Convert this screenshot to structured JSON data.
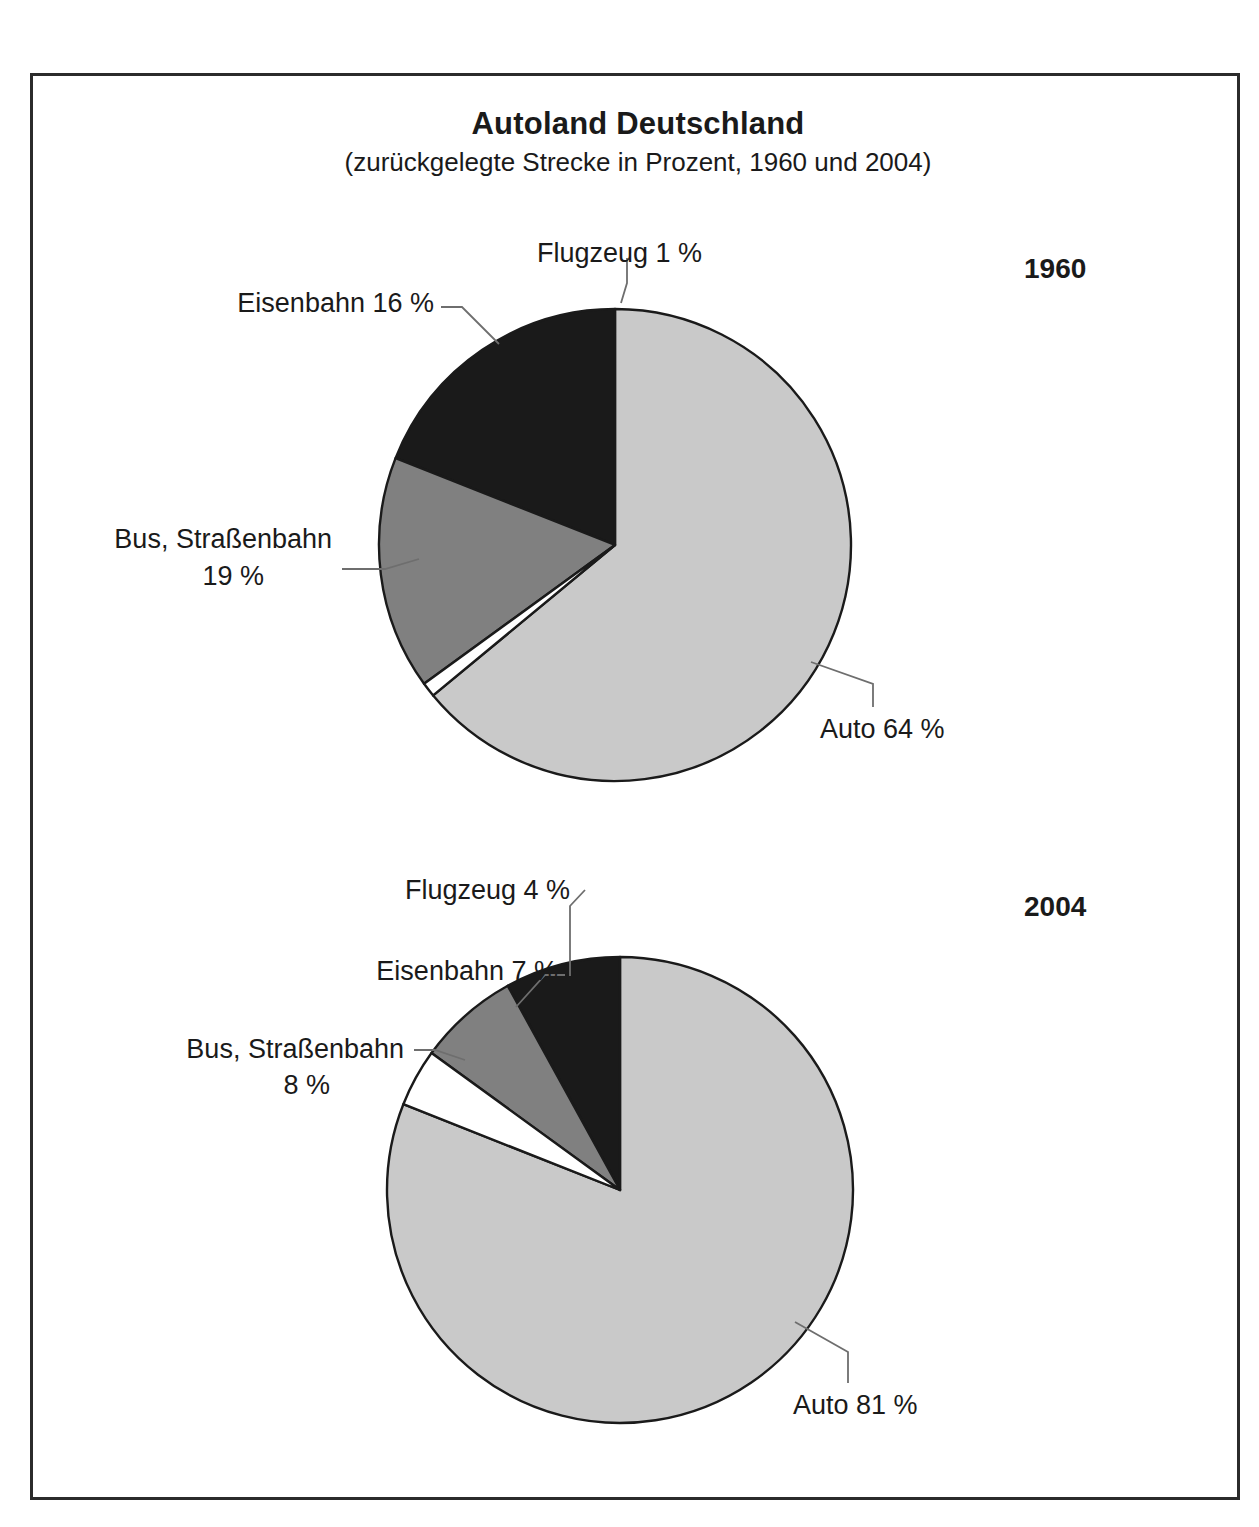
{
  "figure": {
    "title": "Autoland Deutschland",
    "subtitle": "(zurückgelegte Strecke in Prozent, 1960 und 2004)",
    "colors": {
      "auto": "#c9c9c9",
      "eisenbahn": "#808080",
      "bus": "#1a1a1a",
      "flugzeug": "#ffffff",
      "outline": "#1a1a1a",
      "leader": "#6e6e6e",
      "frame": "#2b2b2b",
      "background": "#ffffff"
    }
  },
  "charts": [
    {
      "year_label": "1960",
      "labels": {
        "flugzeug": "Flugzeug 1 %",
        "eisenbahn": "Eisenbahn 16 %",
        "bus_line1": "Bus, Straßenbahn",
        "bus_line2": "19 %",
        "auto": "Auto 64 %"
      }
    },
    {
      "year_label": "2004",
      "labels": {
        "flugzeug": "Flugzeug 4 %",
        "eisenbahn": "Eisenbahn 7 %",
        "bus_line1": "Bus, Straßenbahn",
        "bus_line2": "8 %",
        "auto": "Auto 81 %"
      }
    }
  ],
  "chart_data": [
    {
      "type": "pie",
      "title": "Autoland Deutschland",
      "subtitle": "(zurückgelegte Strecke in Prozent, 1960 und 2004)",
      "series_name": "1960",
      "unit": "%",
      "start_angle_deg": 0,
      "direction": "clockwise",
      "legend": "none (direct labels with leader lines)",
      "categories": [
        "Auto",
        "Flugzeug",
        "Eisenbahn",
        "Bus, Straßenbahn"
      ],
      "values": [
        64,
        1,
        16,
        19
      ],
      "slices": [
        {
          "label": "Auto",
          "value": 64,
          "display": "Auto 64 %",
          "color": "#c9c9c9"
        },
        {
          "label": "Flugzeug",
          "value": 1,
          "display": "Flugzeug 1 %",
          "color": "#ffffff"
        },
        {
          "label": "Eisenbahn",
          "value": 16,
          "display": "Eisenbahn 16 %",
          "color": "#808080"
        },
        {
          "label": "Bus, Straßenbahn",
          "value": 19,
          "display": "Bus, Straßenbahn 19 %",
          "color": "#1a1a1a"
        }
      ]
    },
    {
      "type": "pie",
      "title": "Autoland Deutschland",
      "subtitle": "(zurückgelegte Strecke in Prozent, 1960 und 2004)",
      "series_name": "2004",
      "unit": "%",
      "start_angle_deg": 0,
      "direction": "clockwise",
      "legend": "none (direct labels with leader lines)",
      "categories": [
        "Auto",
        "Flugzeug",
        "Eisenbahn",
        "Bus, Straßenbahn"
      ],
      "values": [
        81,
        4,
        7,
        8
      ],
      "slices": [
        {
          "label": "Auto",
          "value": 81,
          "display": "Auto 81 %",
          "color": "#c9c9c9"
        },
        {
          "label": "Flugzeug",
          "value": 4,
          "display": "Flugzeug 4 %",
          "color": "#ffffff"
        },
        {
          "label": "Eisenbahn",
          "value": 7,
          "display": "Eisenbahn 7 %",
          "color": "#808080"
        },
        {
          "label": "Bus, Straßenbahn",
          "value": 8,
          "display": "Bus, Straßenbahn 8 %",
          "color": "#1a1a1a"
        }
      ]
    }
  ]
}
